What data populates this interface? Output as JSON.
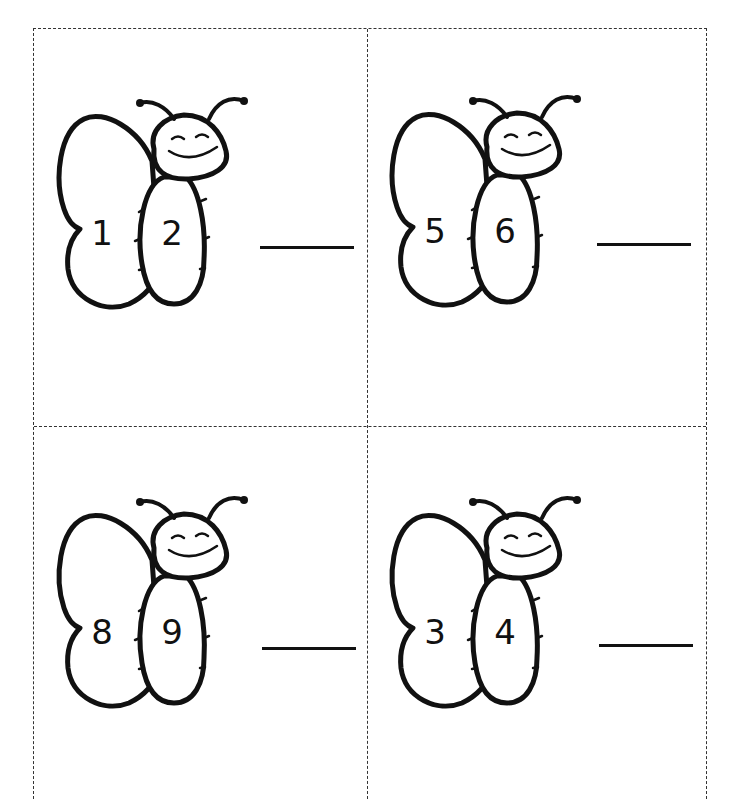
{
  "worksheet": {
    "cards": [
      {
        "id": "card-1",
        "left_wing_number": "1",
        "body_number": "2",
        "answer": ""
      },
      {
        "id": "card-2",
        "left_wing_number": "5",
        "body_number": "6",
        "answer": ""
      },
      {
        "id": "card-3",
        "left_wing_number": "8",
        "body_number": "9",
        "answer": ""
      },
      {
        "id": "card-4",
        "left_wing_number": "3",
        "body_number": "4",
        "answer": ""
      }
    ]
  },
  "colors": {
    "ink": "#111111",
    "border": "#333333",
    "background": "#ffffff"
  }
}
